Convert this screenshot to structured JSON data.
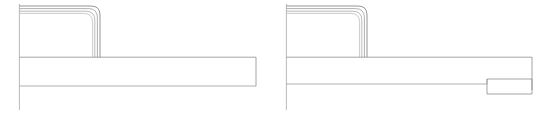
{
  "document": {
    "title": "Technical Line Drawing",
    "kind": "cad-line-drawing",
    "background_color": "#ffffff",
    "canvas": {
      "width": 547,
      "height": 125
    },
    "line_color": "#9a9a9a",
    "line_color_dark": "#7a7a7a",
    "line_color_light": "#bdbdbd",
    "stroke_width": 0.8,
    "view_count": 2
  },
  "views": [
    {
      "name": "view-left",
      "label": "",
      "origin": {
        "x": 19,
        "y": 4
      },
      "datum_line": {
        "name": "vertical-datum-line",
        "x": 19,
        "y1": 4,
        "y2": 110
      },
      "profile": {
        "name": "nested-rounded-profile",
        "nest_count": 4,
        "corner_radius": 9,
        "left_x": 19,
        "top_y": 6,
        "right_x": 100,
        "bottom_y": 57,
        "offsets": [
          0,
          2.6,
          5.2,
          7.4
        ]
      },
      "bar": {
        "name": "horizontal-bar",
        "x1": 19,
        "y1": 57,
        "x2": 256,
        "y2": 86,
        "midline_y": 86,
        "closed_right": true
      },
      "tail": {
        "name": "bar-tail-extension",
        "x1": 19,
        "x2": 256,
        "y": 86
      }
    },
    {
      "name": "view-right",
      "label": "",
      "origin": {
        "x": 286,
        "y": 4
      },
      "datum_line": {
        "name": "vertical-datum-line",
        "x": 286,
        "y1": 4,
        "y2": 110
      },
      "profile": {
        "name": "nested-rounded-profile",
        "nest_count": 4,
        "corner_radius": 9,
        "left_x": 286,
        "top_y": 6,
        "right_x": 367,
        "bottom_y": 57,
        "offsets": [
          0,
          2.6,
          5.2,
          7.4
        ]
      },
      "bar": {
        "name": "horizontal-bar",
        "x1": 286,
        "y1": 57,
        "x2": 532,
        "y2": 90,
        "midline_y": 84,
        "closed_right": true
      },
      "tail": {
        "name": "bar-tail-extension",
        "x1": 286,
        "x2": 487,
        "y": 84
      },
      "detail_block": {
        "name": "end-detail-rectangle",
        "x": 487,
        "y": 79,
        "width": 45,
        "height": 15
      }
    }
  ]
}
